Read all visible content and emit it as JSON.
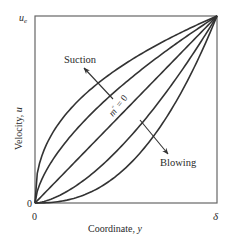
{
  "figure": {
    "xlabel_text": "Coordinate, ",
    "xlabel_var": "y",
    "ylabel_text": "Velocity, ",
    "ylabel_var": "u",
    "y_top_tick": "u",
    "y_top_tick_sub": "e",
    "y_origin_tick": "0",
    "x_origin_tick": "0",
    "x_end_tick": "δ",
    "center_label_m": "m",
    "center_label_rest": " = 0",
    "suction_label": "Suction",
    "blowing_label": "Blowing"
  },
  "chart_data": {
    "type": "line",
    "title": "",
    "xlabel": "Coordinate, y",
    "ylabel": "Velocity, u",
    "xlim": [
      0,
      "δ"
    ],
    "ylim": [
      0,
      "u_e"
    ],
    "grid": false,
    "annotations": [
      "Suction",
      "Blowing",
      "m'' = 0"
    ],
    "series": [
      {
        "name": "strong suction",
        "exponent": 0.42
      },
      {
        "name": "suction",
        "exponent": 0.63
      },
      {
        "name": "m'' = 0",
        "exponent": 1.0
      },
      {
        "name": "blowing",
        "exponent": 1.6
      },
      {
        "name": "strong blowing",
        "exponent": 2.4
      }
    ],
    "curve_form": "u/u_e = (y/δ)^n",
    "colors": {
      "line": "#333333",
      "frame": "#555555"
    }
  }
}
